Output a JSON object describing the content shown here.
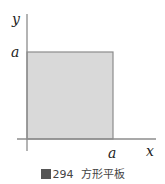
{
  "figure": {
    "axes": {
      "x_label": "x",
      "y_label": "y"
    },
    "square": {
      "x_tick_label": "a",
      "y_tick_label": "a",
      "fill_color": "#d9d9d9",
      "edge_color": "#8c8c8c"
    },
    "axis_color": "#8c8c8c"
  },
  "caption": {
    "number": "294",
    "text": "方形平板"
  }
}
